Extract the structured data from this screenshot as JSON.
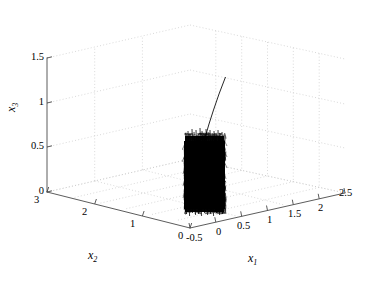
{
  "figure": {
    "kind": "3d-phase-portrait",
    "background_color": "#ffffff",
    "ink_color": "#000000",
    "grid_color": "#c8c8c8",
    "axis_color": "#4d4d4d"
  },
  "axis_labels": {
    "x1": "x",
    "x1_sub": "1",
    "x2": "x",
    "x2_sub": "2",
    "x3": "x",
    "x3_sub": "3"
  },
  "ticks": {
    "x1": [
      "-0.5",
      "0",
      "0.5",
      "1",
      "1.5",
      "2",
      "2.5"
    ],
    "x2": [
      "3",
      "2",
      "1",
      "0"
    ],
    "x3": [
      "0",
      "0.5",
      "1",
      "1.5"
    ]
  },
  "chart_data": {
    "type": "line",
    "title": "",
    "xlabel": "x1",
    "ylabel": "x2",
    "zlabel": "x3",
    "projection": "3d",
    "grid": true,
    "legend": null,
    "xlim": [
      -0.5,
      2.5
    ],
    "ylim": [
      0,
      3
    ],
    "zlim": [
      0,
      1.5
    ],
    "xticks": [
      -0.5,
      0,
      0.5,
      1,
      1.5,
      2,
      2.5
    ],
    "yticks": [
      0,
      1,
      2,
      3
    ],
    "zticks": [
      0,
      0.5,
      1,
      1.5
    ],
    "y_axis_direction": "reversed",
    "series": [
      {
        "name": "transient",
        "color": "#000000",
        "linewidth": 0.6,
        "description": "Thin initial transient segment descending from the upper right into the attractor core.",
        "points": [
          {
            "x1": 0.62,
            "x2": 0.55,
            "x3": 1.3
          },
          {
            "x1": 0.55,
            "x2": 0.6,
            "x3": 1.1
          },
          {
            "x1": 0.47,
            "x2": 0.66,
            "x3": 0.9
          },
          {
            "x1": 0.4,
            "x2": 0.72,
            "x3": 0.72
          },
          {
            "x1": 0.34,
            "x2": 0.78,
            "x3": 0.6
          }
        ]
      },
      {
        "name": "attractor",
        "color": "#000000",
        "linewidth": 0.4,
        "description": "Dense chaotic attractor: a near-vertical slab of tightly wound trajectory filling a narrow band in x1 and the full lower range of x3.",
        "bounds": {
          "x1_min": 0.02,
          "x1_max": 0.52,
          "x2_min": 0.3,
          "x2_max": 1.05,
          "x3_min": 0.0,
          "x3_max": 0.62
        },
        "density": "saturated",
        "sample_count": 4200
      }
    ]
  }
}
